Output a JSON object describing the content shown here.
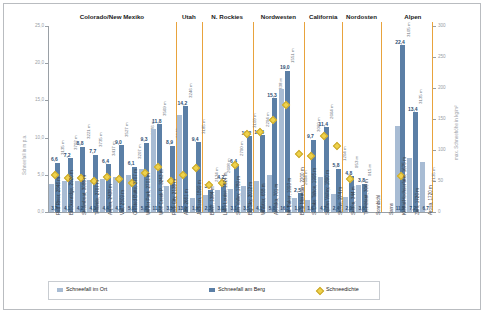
{
  "chart_data": {
    "type": "bar",
    "title": "",
    "ylabel": "Schneefall in m p.a.",
    "y2label": "max. Schneehöhe in kg/m²",
    "xlabel": "",
    "ylim": [
      0,
      25
    ],
    "yticks": [
      "0,0",
      "5,0",
      "10,0",
      "15,0",
      "20,0",
      "25,0"
    ],
    "y2lim": [
      0,
      300
    ],
    "y2ticks": [
      "0",
      "50",
      "100",
      "150",
      "200",
      "250",
      "300"
    ],
    "grid": false,
    "legend_position": "bottom",
    "legend": [
      {
        "label": "Schneefall im Ort",
        "color": "#a8bcd4",
        "marker": "square"
      },
      {
        "label": "Schneefall am Berg",
        "color": "#5b7fa6",
        "marker": "square"
      },
      {
        "label": "Schneedichte",
        "color": "#efd24a",
        "marker": "diamond"
      }
    ],
    "groups": [
      {
        "name": "Colorado/New Mexiko",
        "start": 0,
        "count": 10
      },
      {
        "name": "Utah",
        "start": 10,
        "count": 2
      },
      {
        "name": "N. Rockies",
        "start": 12,
        "count": 4
      },
      {
        "name": "Nordwesten",
        "start": 16,
        "count": 4
      },
      {
        "name": "California",
        "start": 20,
        "count": 3
      },
      {
        "name": "Nordosten",
        "start": 23,
        "count": 3
      },
      {
        "name": "Alpen",
        "start": 26,
        "count": 5
      }
    ],
    "categories": [
      "Red River, 2846 m",
      "Breckenridge, 2926 m",
      "Steamboat, 3085 m",
      "Telluride, 2707 m",
      "Aspen, 2438 m",
      "Vail, 2509 m",
      "Crested Butte, 2707 m",
      "Winter Park, 2701 m",
      "Wolf Creek P., 3243 m",
      "Park City, 2135 m",
      "Alta, 2661 m",
      "Jackson, 1899 m",
      "Banff, 1384 m",
      "Lake Louise, 1524 m",
      "Sun Valley, 1789 m",
      "Big Sky, 2012 m",
      "Whistler, 658 m",
      "Alyeska, 701 m",
      "Mt. Baker, 1093 m",
      "Bear Mountain, 2200 m",
      "S. Lake Tahoe, 1995 m",
      "Squaw Valley, 1890 m",
      "Stowe, 274 m",
      "Sutton, 344 m",
      "Tremblant, 306 m",
      "Sonnbichl",
      "Sarns",
      "Kühtai/Hochserfaus, 1675 m",
      "Zürs, 1720 m",
      "Arosa, 1720 m"
    ],
    "series": [
      {
        "name": "Schneefall im Ort",
        "color": "#a8bcd4",
        "values": [
          3.7,
          4.1,
          4.2,
          4.3,
          4.4,
          4.7,
          5.0,
          5.8,
          11.1,
          3.5,
          13.0,
          1.9,
          2.3,
          3.0,
          3.1,
          3.5,
          4.1,
          5.0,
          16.5,
          1.9,
          1.6,
          4.7,
          2.4,
          2.0,
          3.6,
          null,
          null,
          11.5,
          7.2,
          6.7
        ]
      },
      {
        "name": "Schneefall am Berg",
        "color": "#5b7fa6",
        "values": [
          6.6,
          7.2,
          8.8,
          7.7,
          6.4,
          9.0,
          6.1,
          9.3,
          11.8,
          8.9,
          14.2,
          9.4,
          3.0,
          4.2,
          6.4,
          10.2,
          10.3,
          15.3,
          19.0,
          2.5,
          9.7,
          11.4,
          5.8,
          4.8,
          3.8,
          null,
          null,
          22.4,
          13.4,
          null
        ]
      }
    ],
    "bar_value_labels_berg": [
      "6,6",
      "7,2",
      "8,8",
      "7,7",
      "6,4",
      "9,0",
      "6,1",
      "9,3",
      "11,8",
      "8,9",
      "14,2",
      "9,4",
      "3,0",
      "4,2",
      "6,4",
      "10,2",
      "10,3",
      "15,3",
      "19,0",
      "2,5",
      "9,7",
      "11,4",
      "5,8",
      "4,8",
      "3,8",
      "",
      "",
      "22,4",
      "13,4",
      ""
    ],
    "bar_value_labels_ort": [
      "3,7",
      "4,1",
      "4,2",
      "4,3",
      "4,4",
      "4,7",
      "5,0",
      "5,8",
      "11,1",
      "3,5",
      "13,0",
      "1,9",
      "2,3",
      "3,0",
      "3,1",
      "3,5",
      "4,1",
      "5,0",
      "16,5",
      "1,9",
      "1,6",
      "4,7",
      "2,4",
      "2,0",
      "3,6",
      "",
      "",
      "11,5",
      "7,2",
      "6,7"
    ],
    "altitude_labels": [
      "3135 m",
      "3702 m",
      "3221 m",
      "3735 m",
      "3417 m",
      "3527 m",
      "3207 m",
      "3676 m",
      "3569 m",
      "3048 m",
      "3246 m",
      "3185 m",
      "2134 m",
      "2608 m",
      "2790 m",
      "3109 m",
      "2294 m",
      "838 m",
      "1551 m",
      "2694 m",
      "3060 m",
      "2664 m",
      "1204 m",
      "953 m",
      "915 m",
      "",
      "",
      "3105 m",
      "3135 m",
      "2135 m"
    ],
    "altitude_labels_alps_extra": [
      "3135 m",
      "3105 m",
      "1675 m",
      "2135 m",
      "2135 m"
    ],
    "density_points": [
      {
        "index": 0,
        "value": 62
      },
      {
        "index": 1,
        "value": 57
      },
      {
        "index": 2,
        "value": 57
      },
      {
        "index": 3,
        "value": 52
      },
      {
        "index": 4,
        "value": 58
      },
      {
        "index": 5,
        "value": 55
      },
      {
        "index": 6,
        "value": 48
      },
      {
        "index": 7,
        "value": 65
      },
      {
        "index": 8,
        "value": 75
      },
      {
        "index": 9,
        "value": 52
      },
      {
        "index": 10,
        "value": 62
      },
      {
        "index": 11,
        "value": 72
      },
      {
        "index": 12,
        "value": 45
      },
      {
        "index": 13,
        "value": 48
      },
      {
        "index": 14,
        "value": 78
      },
      {
        "index": 15,
        "value": 128
      },
      {
        "index": 16,
        "value": 130
      },
      {
        "index": 17,
        "value": 150
      },
      {
        "index": 18,
        "value": 175
      },
      {
        "index": 19,
        "value": 95
      },
      {
        "index": 20,
        "value": 92
      },
      {
        "index": 21,
        "value": 125
      },
      {
        "index": 22,
        "value": 108
      },
      {
        "index": 23,
        "value": 55
      },
      {
        "index": 27,
        "value": 60
      }
    ]
  }
}
